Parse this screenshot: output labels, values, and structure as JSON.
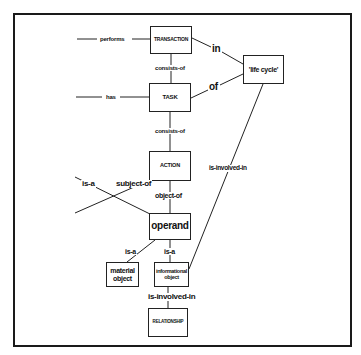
{
  "diagram": {
    "type": "entity-relationship concept diagram",
    "nodes": {
      "transaction": "TRANSACTION",
      "task": "TASK",
      "action": "ACTION",
      "operand": "operand",
      "life_cycle": "'life cycle'",
      "material_object": "material object",
      "informational_object": "informational object",
      "relationship": "RELATIONSHIP"
    },
    "edges": {
      "performs": "performs",
      "has": "has",
      "transaction_consists_of": "consists-of",
      "task_consists_of": "consists-of",
      "in": "in",
      "of": "of",
      "subject_of": "subject-of",
      "is_a_left": "is-a",
      "object_of": "object-of",
      "operand_is_a_material": "is-a",
      "operand_is_a_informational": "is-a",
      "lifecycle_is_involved_in": "is-involved-in",
      "informational_is_involved_in": "is-involved-in"
    },
    "colors": {
      "line": "#222222",
      "background": "#ffffff",
      "frame": "#1a1a1a"
    }
  }
}
